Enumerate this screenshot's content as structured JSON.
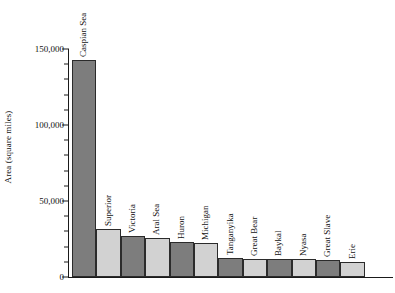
{
  "chart_data": {
    "type": "bar",
    "title": "",
    "xlabel": "",
    "ylabel": "Area (square miles)",
    "ylim": [
      0,
      150000
    ],
    "ytick_values": [
      0,
      50000,
      100000,
      150000
    ],
    "ytick_labels": [
      "0",
      "50,000",
      "100,000",
      "150,000"
    ],
    "minor_tick_interval": 10000,
    "grid": false,
    "legend": "none",
    "categories": [
      "Caspian Sea",
      "Superior",
      "Victoria",
      "Aral Sea",
      "Huron",
      "Michigan",
      "Tanganyika",
      "Great Bear",
      "Baykal",
      "Nyasa",
      "Great Slave",
      "Erie"
    ],
    "values": [
      143000,
      31700,
      26800,
      25700,
      23000,
      22300,
      12700,
      12000,
      11800,
      11600,
      11000,
      9900
    ],
    "bar_colors": [
      "#7d7d7d",
      "#d2d2d2",
      "#7d7d7d",
      "#d2d2d2",
      "#7d7d7d",
      "#d2d2d2",
      "#7d7d7d",
      "#d2d2d2",
      "#7d7d7d",
      "#d2d2d2",
      "#7d7d7d",
      "#d2d2d2"
    ],
    "bar_edge_color": "#2b2b2b",
    "axis_color": "#1a1a1a",
    "background_color": "#ffffff"
  }
}
